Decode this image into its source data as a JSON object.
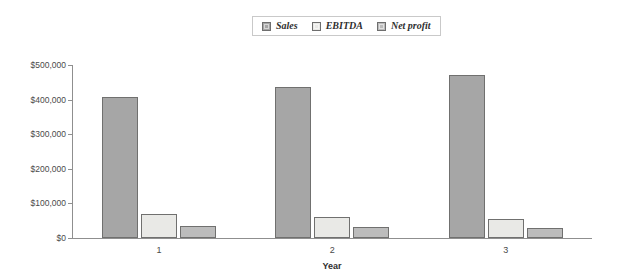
{
  "chart_data": {
    "type": "bar",
    "title": "",
    "xlabel": "Year",
    "ylabel": "",
    "categories": [
      "1",
      "2",
      "3"
    ],
    "series": [
      {
        "name": "Sales",
        "values": [
          407000,
          437000,
          472000
        ],
        "color": "#a6a6a6"
      },
      {
        "name": "EBITDA",
        "values": [
          68000,
          61000,
          56000
        ],
        "color": "#e9e9e6"
      },
      {
        "name": "Net profit",
        "values": [
          35000,
          32000,
          28000
        ],
        "color": "#bcbcbc"
      }
    ],
    "ylim": [
      0,
      500000
    ],
    "ytick_values": [
      0,
      100000,
      200000,
      300000,
      400000,
      500000
    ],
    "ytick_labels": [
      "$0",
      "$100,000",
      "$200,000",
      "$300,000",
      "$400,000",
      "$500,000"
    ],
    "grid": false,
    "legend_position": "top-center"
  },
  "legend": {
    "items": [
      {
        "label": "Sales",
        "color": "#a6a6a6"
      },
      {
        "label": "EBITDA",
        "color": "#e9e9e6"
      },
      {
        "label": "Net profit",
        "color": "#bcbcbc"
      }
    ]
  },
  "axis": {
    "x_title": "Year",
    "x_labels": [
      "1",
      "2",
      "3"
    ],
    "y_labels": [
      "$500,000",
      "$400,000",
      "$300,000",
      "$200,000",
      "$100,000",
      "$0"
    ]
  }
}
